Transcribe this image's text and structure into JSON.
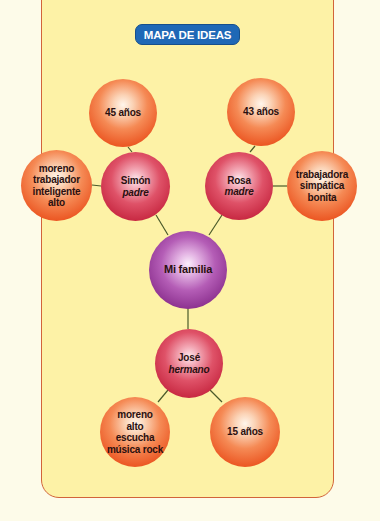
{
  "title": "MAPA DE IDEAS",
  "colors": {
    "frame_fill": "#fdf2a6",
    "frame_border": "#d2643a",
    "title_badge": "#1f68b6",
    "attribute_node": "#ec5a26",
    "person_node": "#c92b44",
    "center_node": "#8e3391",
    "link": "#4a5a2a"
  },
  "center": {
    "label": "Mi familia"
  },
  "people": [
    {
      "name": "Simón",
      "role": "padre",
      "age": "45 años",
      "traits": [
        "moreno",
        "trabajador",
        "inteligente",
        "alto"
      ]
    },
    {
      "name": "Rosa",
      "role": "madre",
      "age": "43 años",
      "traits": [
        "trabajadora",
        "simpática",
        "bonita"
      ]
    },
    {
      "name": "José",
      "role": "hermano",
      "age": "15 años",
      "traits": [
        "moreno",
        "alto",
        "escucha",
        "música rock"
      ]
    }
  ]
}
